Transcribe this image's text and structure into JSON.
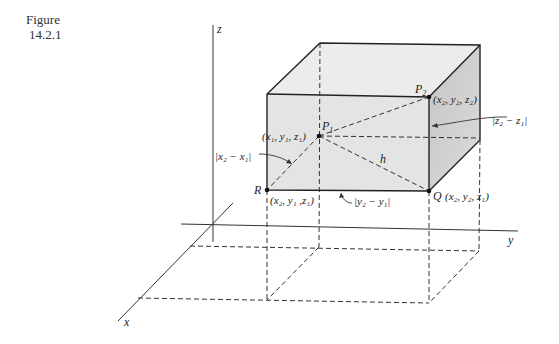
{
  "caption": {
    "label": "Figure",
    "number": "14.2.1"
  },
  "axes": {
    "x_label": "x",
    "y_label": "y",
    "z_label": "z"
  },
  "points": {
    "P1": {
      "name": "P",
      "sub": "1",
      "coords": "(x₁, y₁, z₁)"
    },
    "P2": {
      "name": "P",
      "sub": "2",
      "coords": "(x₂, y₂, z₂)"
    },
    "Q": {
      "name": "Q",
      "coords": "(x₂, y₂, z₁)"
    },
    "R": {
      "name": "R",
      "coords": "(x₂, y₁ ,z₁)"
    }
  },
  "lengths": {
    "dx": "|x₂ − x₁|",
    "dy": "|y₂ − y₁|",
    "dz": "|z₂ − z₁|",
    "h": "h"
  },
  "colors": {
    "front_face": "#e6e6e6",
    "top_face": "#ececec",
    "side_face": "#cfcfcf",
    "line": "#333333"
  }
}
